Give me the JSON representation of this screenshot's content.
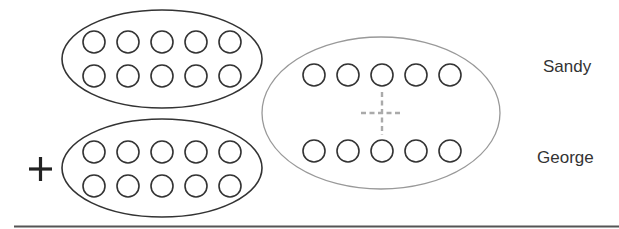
{
  "labels": {
    "top": "Sandy",
    "bottom": "George"
  },
  "operator": "+",
  "groups": {
    "top_left": {
      "rows": 2,
      "per_row": 5,
      "count": 10
    },
    "bottom_left": {
      "rows": 2,
      "per_row": 5,
      "count": 10
    },
    "right": {
      "rows": 2,
      "per_row": 5,
      "count": 10,
      "center_marker": "dashed-crosshair"
    }
  },
  "colors": {
    "stroke_dark": "#333333",
    "stroke_gray": "#999999",
    "dash": "#aaaaaa",
    "baseline": "#555555"
  }
}
